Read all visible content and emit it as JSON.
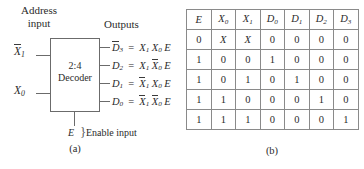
{
  "figure": {
    "panel_a": {
      "caption": "(a)",
      "address_input_label": "Address\ninput",
      "address_input_line1": "Address",
      "address_input_line2": "input",
      "outputs_label": "Outputs",
      "block_line1": "2:4",
      "block_line2": "Decoder",
      "enable_label": "E",
      "enable_brace": "}",
      "enable_caption": "Enable input",
      "inputs": [
        {
          "name": "x1-input",
          "base": "X",
          "sub": "1",
          "overline": true
        },
        {
          "name": "x0-input",
          "base": "X",
          "sub": "0",
          "overline": false
        }
      ],
      "outputs": [
        {
          "name": "d3-output",
          "lhs_base": "D",
          "lhs_sub": "3",
          "lhs_overline": true,
          "equals": "=",
          "terms": [
            {
              "base": "X",
              "sub": "1",
              "overline": false
            },
            {
              "base": "X",
              "sub": "0",
              "overline": false
            },
            {
              "base": "E",
              "sub": "",
              "overline": false
            }
          ]
        },
        {
          "name": "d2-output",
          "lhs_base": "D",
          "lhs_sub": "2",
          "lhs_overline": false,
          "equals": "=",
          "terms": [
            {
              "base": "X",
              "sub": "1",
              "overline": false
            },
            {
              "base": "X",
              "sub": "0",
              "overline": true
            },
            {
              "base": "E",
              "sub": "",
              "overline": false
            }
          ]
        },
        {
          "name": "d1-output",
          "lhs_base": "D",
          "lhs_sub": "1",
          "lhs_overline": false,
          "equals": "=",
          "terms": [
            {
              "base": "X",
              "sub": "1",
              "overline": true
            },
            {
              "base": "X",
              "sub": "0",
              "overline": false
            },
            {
              "base": "E",
              "sub": "",
              "overline": false
            }
          ]
        },
        {
          "name": "d0-output",
          "lhs_base": "D",
          "lhs_sub": "0",
          "lhs_overline": false,
          "equals": "=",
          "terms": [
            {
              "base": "X",
              "sub": "1",
              "overline": true
            },
            {
              "base": "X",
              "sub": "0",
              "overline": true
            },
            {
              "base": "E",
              "sub": "",
              "overline": false
            }
          ]
        }
      ]
    },
    "panel_b": {
      "caption": "(b)",
      "table": {
        "headers": [
          {
            "base": "E",
            "sub": ""
          },
          {
            "base": "X",
            "sub": "0"
          },
          {
            "base": "X",
            "sub": "1"
          },
          {
            "base": "D",
            "sub": "0"
          },
          {
            "base": "D",
            "sub": "1"
          },
          {
            "base": "D",
            "sub": "2"
          },
          {
            "base": "D",
            "sub": "3"
          }
        ],
        "rows": [
          [
            "0",
            "X",
            "X",
            "0",
            "0",
            "0",
            "0"
          ],
          [
            "1",
            "0",
            "0",
            "1",
            "0",
            "0",
            "0"
          ],
          [
            "1",
            "0",
            "1",
            "0",
            "1",
            "0",
            "0"
          ],
          [
            "1",
            "1",
            "0",
            "0",
            "0",
            "1",
            "0"
          ],
          [
            "1",
            "1",
            "1",
            "0",
            "0",
            "0",
            "1"
          ]
        ]
      }
    }
  },
  "colors": {
    "ink": "#2b2b2b",
    "line": "#6b6b6b",
    "table_border": "#8a8a8a",
    "background": "#ffffff"
  }
}
